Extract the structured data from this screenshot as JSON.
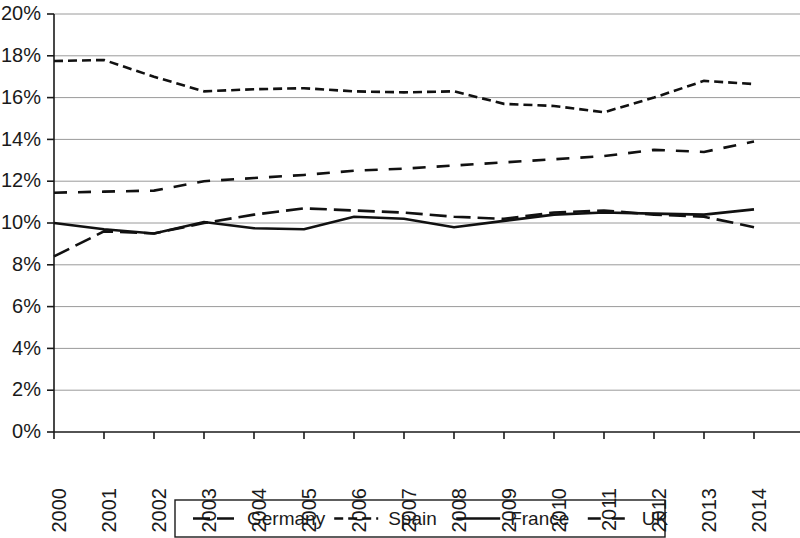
{
  "chart_data": {
    "type": "line",
    "title": "",
    "subtitle": "",
    "xlabel": "",
    "ylabel": "",
    "grid": "horizontal",
    "legend_position": "bottom",
    "x": [
      2000,
      2001,
      2002,
      2003,
      2004,
      2005,
      2006,
      2007,
      2008,
      2009,
      2010,
      2011,
      2012,
      2013,
      2014
    ],
    "categories": [
      "2000",
      "2001",
      "2002",
      "2003",
      "2004",
      "2005",
      "2006",
      "2007",
      "2008",
      "2009",
      "2010",
      "2011",
      "2012",
      "2013",
      "2014"
    ],
    "ylim": [
      0,
      20
    ],
    "ytick_values": [
      0,
      2,
      4,
      6,
      8,
      10,
      12,
      14,
      16,
      18,
      20
    ],
    "ytick_labels": [
      "0%",
      "2%",
      "4%",
      "6%",
      "8%",
      "10%",
      "12%",
      "14%",
      "16%",
      "18%",
      "20%"
    ],
    "yunit": "%",
    "series": [
      {
        "name": "Germany",
        "style": "long-dash",
        "color": "#111111",
        "values": [
          8.4,
          9.6,
          9.5,
          10.0,
          10.4,
          10.7,
          10.6,
          10.5,
          10.3,
          10.2,
          10.5,
          10.6,
          10.4,
          10.3,
          9.8
        ]
      },
      {
        "name": "Spain",
        "style": "short-dash",
        "color": "#111111",
        "values": [
          17.75,
          17.8,
          17.0,
          16.3,
          16.4,
          16.45,
          16.3,
          16.25,
          16.3,
          15.7,
          15.6,
          15.3,
          16.0,
          16.8,
          16.65
        ]
      },
      {
        "name": "France",
        "style": "solid",
        "color": "#111111",
        "values": [
          10.0,
          9.7,
          9.5,
          10.05,
          9.75,
          9.7,
          10.3,
          10.2,
          9.8,
          10.1,
          10.4,
          10.5,
          10.45,
          10.4,
          10.65
        ]
      },
      {
        "name": "UK",
        "style": "dash-gap",
        "color": "#111111",
        "values": [
          11.45,
          11.5,
          11.55,
          12.0,
          12.15,
          12.3,
          12.5,
          12.6,
          12.75,
          12.9,
          13.05,
          13.2,
          13.5,
          13.4,
          13.9
        ]
      }
    ]
  },
  "legend": {
    "items": [
      {
        "label": "Germany",
        "style": "long-dash"
      },
      {
        "label": "Spain",
        "style": "short-dash"
      },
      {
        "label": "France",
        "style": "solid"
      },
      {
        "label": "UK",
        "style": "dash-gap"
      }
    ]
  }
}
